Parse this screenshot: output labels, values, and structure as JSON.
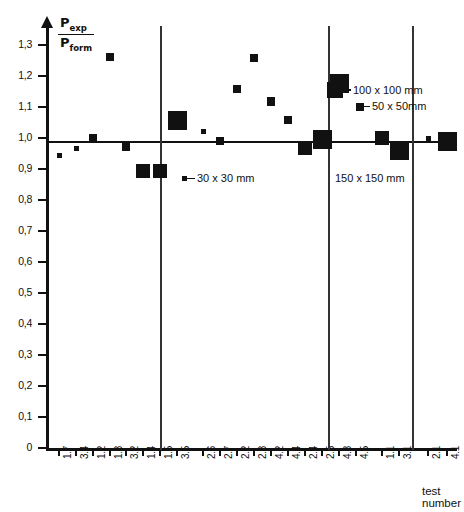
{
  "chart_data": {
    "type": "scatter",
    "title": "",
    "ylabel_numerator": "P",
    "ylabel_numerator_sub": "exp",
    "ylabel_denominator": "P",
    "ylabel_denominator_sub": "form",
    "xlabel": "test\nnumber",
    "xlabel_line1": "test",
    "xlabel_line2": "number",
    "ylim": [
      0,
      1.3
    ],
    "ytick_labels": [
      "0",
      "0,1",
      "0,2",
      "0,3",
      "0,4",
      "0,5",
      "0,6",
      "0,7",
      "0,8",
      "0,9",
      "1,0",
      "1,1",
      "1,2",
      "1,3"
    ],
    "ytick_values": [
      0,
      0.1,
      0.2,
      0.3,
      0.4,
      0.5,
      0.6,
      0.7,
      0.8,
      0.9,
      1.0,
      1.1,
      1.2,
      1.3
    ],
    "grid": false,
    "reference_line": 1.0,
    "categories": [
      "1.7",
      "3.4",
      "1.2",
      "1.3",
      "3.2",
      "1.4",
      "1.5",
      "3.5",
      "2.6",
      "2.7",
      "2.2",
      "2.3",
      "4.2",
      "4.4",
      "2.4",
      "2.5",
      "4.3",
      "4.5",
      "1.1",
      "3.1",
      "2.1",
      "4.1"
    ],
    "values": [
      0.945,
      0.965,
      0.998,
      1.262,
      0.972,
      0.893,
      0.893,
      1.055,
      1.022,
      0.99,
      1.158,
      1.258,
      1.118,
      1.058,
      0.968,
      0.995,
      null,
      null,
      1.0,
      0.96,
      1.0,
      0.99
    ],
    "points": [
      {
        "test": "1.7",
        "value": 0.945,
        "size": "30x30"
      },
      {
        "test": "3.4",
        "value": 0.965,
        "size": "30x30"
      },
      {
        "test": "1.2",
        "value": 0.998,
        "size": "50x50"
      },
      {
        "test": "1.3",
        "value": 1.262,
        "size": "50x50"
      },
      {
        "test": "3.2",
        "value": 0.972,
        "size": "50x50"
      },
      {
        "test": "1.4",
        "value": 0.893,
        "size": "100x100"
      },
      {
        "test": "1.5",
        "value": 0.893,
        "size": "100x100"
      },
      {
        "test": "3.5",
        "value": 1.055,
        "size": "150x150"
      },
      {
        "test": "2.6",
        "value": 1.022,
        "size": "30x30"
      },
      {
        "test": "2.7",
        "value": 0.99,
        "size": "50x50"
      },
      {
        "test": "2.2",
        "value": 1.158,
        "size": "50x50"
      },
      {
        "test": "2.3",
        "value": 1.258,
        "size": "50x50"
      },
      {
        "test": "4.2",
        "value": 1.118,
        "size": "50x50"
      },
      {
        "test": "4.4",
        "value": 1.058,
        "size": "50x50"
      },
      {
        "test": "2.4",
        "value": 0.968,
        "size": "100x100"
      },
      {
        "test": "2.5",
        "value": 0.995,
        "size": "150x150"
      },
      {
        "test": "4.3",
        "value": 1.175,
        "size": "150x150"
      },
      {
        "test": "1.1",
        "value": 1.0,
        "size": "100x100"
      },
      {
        "test": "3.1",
        "value": 0.96,
        "size": "150x150"
      },
      {
        "test": "2.1",
        "value": 1.0,
        "size": "30x30"
      },
      {
        "test": "4.1",
        "value": 0.99,
        "size": "150x150"
      }
    ],
    "legend": [
      {
        "label": "100 x 100 mm",
        "size": "100x100"
      },
      {
        "label": "50 x 50mm",
        "size": "50x50"
      },
      {
        "label": "30 x 30 mm",
        "size": "30x30"
      },
      {
        "label": "150 x 150 mm",
        "size": "150x150"
      }
    ],
    "group_separators": [
      8,
      18,
      20
    ]
  }
}
